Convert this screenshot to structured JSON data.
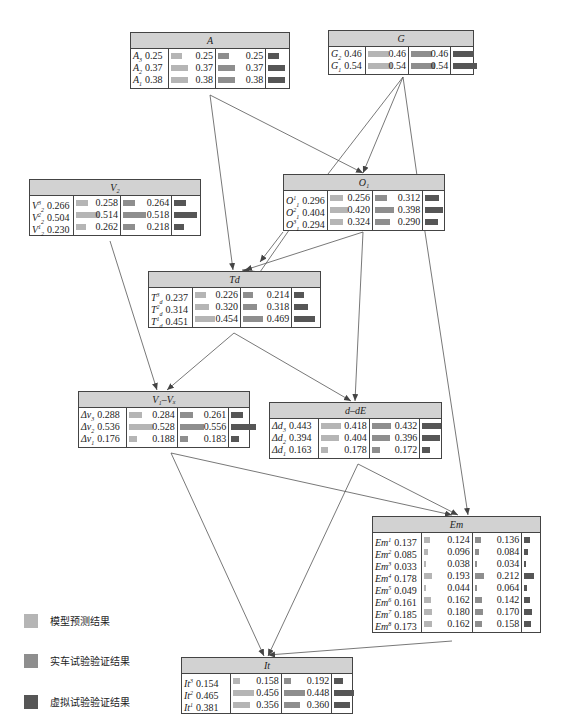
{
  "legend": [
    {
      "label": "模型预测结果",
      "color": "#b5b5b5"
    },
    {
      "label": "实车试验验证结果",
      "color": "#8e8e8e"
    },
    {
      "label": "虚拟试验验证结果",
      "color": "#565656"
    }
  ],
  "colors": {
    "model": "#b5b5b5",
    "real": "#8e8e8e",
    "virtual": "#565656",
    "header": "#d2d2d2",
    "border": "#444444"
  },
  "nodes": [
    {
      "id": "A",
      "title": "A",
      "x": 130,
      "y": 32,
      "w": 160,
      "cols": [
        38,
        48,
        51,
        23
      ],
      "rows": [
        {
          "base": "A",
          "sub": "3",
          "sup": "",
          "v": [
            "0.25",
            "0.25",
            "0.25"
          ]
        },
        {
          "base": "A",
          "sub": "2",
          "sup": "",
          "v": [
            "0.37",
            "0.37",
            "0.37"
          ]
        },
        {
          "base": "A",
          "sub": "1",
          "sup": "",
          "v": [
            "0.38",
            "0.38",
            "0.38"
          ]
        }
      ]
    },
    {
      "id": "G",
      "title": "G",
      "x": 328,
      "y": 30,
      "w": 146,
      "cols": [
        37,
        44,
        43,
        22
      ],
      "rows": [
        {
          "base": "G",
          "sub": "2",
          "sup": "",
          "v": [
            "0.46",
            "0.46",
            "0.46"
          ]
        },
        {
          "base": "G",
          "sub": "1",
          "sup": "",
          "v": [
            "0.54",
            "0.54",
            "0.54"
          ]
        }
      ]
    },
    {
      "id": "V2",
      "title": "V₂",
      "x": 29,
      "y": 179,
      "w": 172,
      "cols": [
        45,
        47,
        52,
        28
      ],
      "rows": [
        {
          "base": "V",
          "sub": "2",
          "sup": "3",
          "v": [
            "0.266",
            "0.258",
            "0.264"
          ]
        },
        {
          "base": "V",
          "sub": "2",
          "sup": "2",
          "v": [
            "0.504",
            "0.514",
            "0.518"
          ]
        },
        {
          "base": "V",
          "sub": "2",
          "sup": "1",
          "v": [
            "0.230",
            "0.262",
            "0.218"
          ]
        }
      ]
    },
    {
      "id": "O1",
      "title": "O₁",
      "x": 283,
      "y": 174,
      "w": 162,
      "cols": [
        45,
        45,
        51,
        21
      ],
      "rows": [
        {
          "base": "O",
          "sub": "1",
          "sup": "1",
          "v": [
            "0.296",
            "0.256",
            "0.312"
          ]
        },
        {
          "base": "O",
          "sub": "1",
          "sup": "2",
          "v": [
            "0.404",
            "0.420",
            "0.398"
          ]
        },
        {
          "base": "O",
          "sub": "1",
          "sup": "3",
          "v": [
            "0.294",
            "0.324",
            "0.290"
          ]
        }
      ]
    },
    {
      "id": "Td",
      "title": "Td",
      "x": 148,
      "y": 271,
      "w": 173,
      "cols": [
        45,
        48,
        52,
        28
      ],
      "rows": [
        {
          "base": "T",
          "sub": "d",
          "sup": "3",
          "v": [
            "0.237",
            "0.226",
            "0.214"
          ]
        },
        {
          "base": "T",
          "sub": "d",
          "sup": "2",
          "v": [
            "0.314",
            "0.320",
            "0.318"
          ]
        },
        {
          "base": "T",
          "sub": "d",
          "sup": "1",
          "v": [
            "0.451",
            "0.454",
            "0.469"
          ]
        }
      ]
    },
    {
      "id": "V1Vx",
      "title": "V₁–Vₓ",
      "x": 78,
      "y": 391,
      "w": 172,
      "cols": [
        49,
        51,
        52,
        20
      ],
      "rows": [
        {
          "base": "Δv",
          "sub": "3",
          "sup": "",
          "v": [
            "0.288",
            "0.284",
            "0.261"
          ]
        },
        {
          "base": "Δv",
          "sub": "2",
          "sup": "",
          "v": [
            "0.536",
            "0.528",
            "0.556"
          ]
        },
        {
          "base": "Δv",
          "sub": "1",
          "sup": "",
          "v": [
            "0.176",
            "0.188",
            "0.183"
          ]
        }
      ]
    },
    {
      "id": "ddE",
      "title": "d–dE",
      "x": 269,
      "y": 402,
      "w": 173,
      "cols": [
        50,
        51,
        51,
        21
      ],
      "rows": [
        {
          "base": "Δd",
          "sub": "3",
          "sup": "",
          "v": [
            "0.443",
            "0.418",
            "0.432"
          ]
        },
        {
          "base": "Δd",
          "sub": "2",
          "sup": "",
          "v": [
            "0.394",
            "0.404",
            "0.396"
          ]
        },
        {
          "base": "Δd",
          "sub": "1",
          "sup": "",
          "v": [
            "0.163",
            "0.178",
            "0.172"
          ]
        }
      ]
    },
    {
      "id": "Em",
      "title": "Em",
      "x": 372,
      "y": 516,
      "w": 169,
      "cols": [
        50,
        51,
        50,
        18
      ],
      "rows": [
        {
          "base": "Em",
          "sub": "",
          "sup": "1",
          "v": [
            "0.137",
            "0.124",
            "0.136"
          ]
        },
        {
          "base": "Em",
          "sub": "",
          "sup": "2",
          "v": [
            "0.085",
            "0.096",
            "0.084"
          ]
        },
        {
          "base": "Em",
          "sub": "",
          "sup": "3",
          "v": [
            "0.033",
            "0.038",
            "0.034"
          ]
        },
        {
          "base": "Em",
          "sub": "",
          "sup": "4",
          "v": [
            "0.178",
            "0.193",
            "0.212"
          ]
        },
        {
          "base": "Em",
          "sub": "",
          "sup": "5",
          "v": [
            "0.049",
            "0.044",
            "0.064"
          ]
        },
        {
          "base": "Em",
          "sub": "",
          "sup": "6",
          "v": [
            "0.161",
            "0.162",
            "0.142"
          ]
        },
        {
          "base": "Em",
          "sub": "",
          "sup": "7",
          "v": [
            "0.185",
            "0.180",
            "0.170"
          ]
        },
        {
          "base": "Em",
          "sub": "",
          "sup": "8",
          "v": [
            "0.173",
            "0.162",
            "0.158"
          ]
        }
      ]
    },
    {
      "id": "It",
      "title": "It",
      "x": 181,
      "y": 657,
      "w": 172,
      "cols": [
        50,
        51,
        51,
        20
      ],
      "rows": [
        {
          "base": "It",
          "sub": "",
          "sup": "3",
          "v": [
            "0.154",
            "0.158",
            "0.192"
          ]
        },
        {
          "base": "It",
          "sub": "",
          "sup": "2",
          "v": [
            "0.465",
            "0.456",
            "0.448"
          ]
        },
        {
          "base": "It",
          "sub": "",
          "sup": "1",
          "v": [
            "0.381",
            "0.356",
            "0.360"
          ]
        }
      ]
    }
  ],
  "edges": [
    {
      "from": "A",
      "to": "O1",
      "pts": [
        210,
        95,
        363,
        173
      ]
    },
    {
      "from": "A",
      "to": "Td",
      "pts": [
        210,
        95,
        233,
        270
      ]
    },
    {
      "from": "G",
      "to": "O1",
      "pts": [
        403,
        77,
        363,
        173
      ]
    },
    {
      "from": "G",
      "to": "Td",
      "pts": [
        403,
        77,
        328,
        174,
        260,
        272,
        242,
        270
      ]
    },
    {
      "from": "G",
      "to": "Em",
      "pts": [
        403,
        77,
        425,
        232,
        468,
        515
      ]
    },
    {
      "from": "O1",
      "to": "Td",
      "pts": [
        363,
        232,
        245,
        270
      ]
    },
    {
      "from": "O1",
      "to": "ddE",
      "pts": [
        363,
        232,
        355,
        401
      ]
    },
    {
      "from": "O1",
      "to": "Td2",
      "pts": [
        283,
        232,
        260,
        262
      ]
    },
    {
      "from": "V2",
      "to": "V1Vx",
      "pts": [
        110,
        241,
        157,
        390
      ]
    },
    {
      "from": "Td",
      "to": "V1Vx",
      "pts": [
        234,
        333,
        167,
        390
      ]
    },
    {
      "from": "Td",
      "to": "ddE",
      "pts": [
        234,
        333,
        351,
        401
      ]
    },
    {
      "from": "V1Vx",
      "to": "It",
      "pts": [
        171,
        453,
        264,
        656
      ]
    },
    {
      "from": "V1Vx",
      "to": "Em",
      "pts": [
        171,
        453,
        452,
        515
      ]
    },
    {
      "from": "ddE",
      "to": "It",
      "pts": [
        358,
        464,
        268,
        656
      ]
    },
    {
      "from": "ddE",
      "to": "Em",
      "pts": [
        358,
        464,
        458,
        515
      ]
    },
    {
      "from": "Em",
      "to": "It",
      "pts": [
        452,
        641,
        268,
        655
      ]
    }
  ]
}
